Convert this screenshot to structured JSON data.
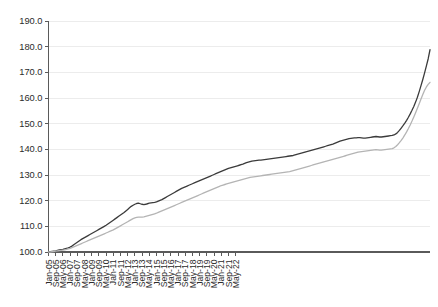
{
  "chart_data": {
    "type": "line",
    "title": "",
    "subtitle": "",
    "xlabel": "",
    "ylabel": "",
    "ylim": [
      100.0,
      190.0
    ],
    "yticks": [
      100.0,
      110.0,
      120.0,
      130.0,
      140.0,
      150.0,
      160.0,
      170.0,
      180.0,
      190.0
    ],
    "ytick_labels": [
      "100.0",
      "110.0",
      "120.0",
      "130.0",
      "140.0",
      "150.0",
      "160.0",
      "170.0",
      "180.0",
      "190.0"
    ],
    "grid": true,
    "grid_axis": "y",
    "legend": "none",
    "legend_entries": [],
    "xtick_labels": [
      "Jan-05",
      "Sep-05",
      "May-06",
      "Jan-07",
      "Sep-07",
      "May-08",
      "Jan-09",
      "Sep-09",
      "May-10",
      "Jan-11",
      "Sep-11",
      "May-12",
      "Jan-13",
      "Sep-13",
      "May-14",
      "Jan-15",
      "Sep-15",
      "May-16",
      "Jan-17",
      "Sep-17",
      "May-18",
      "Jan-19",
      "Sep-19",
      "May-20",
      "Jan-21",
      "Sep-21",
      "May-22"
    ],
    "xtick_interval_months": 4,
    "x_start": "Jan-05",
    "x_end": "Sep-22",
    "series": [
      {
        "name": "series-dark",
        "color": "#3b3b3b",
        "linewidth": 1.3,
        "x": [
          "Jan-05",
          "Feb-05",
          "Mar-05",
          "Apr-05",
          "May-05",
          "Jun-05",
          "Jul-05",
          "Aug-05",
          "Sep-05",
          "Oct-05",
          "Nov-05",
          "Dec-05",
          "Jan-06",
          "Feb-06",
          "Mar-06",
          "Apr-06",
          "May-06",
          "Jun-06",
          "Jul-06",
          "Aug-06",
          "Sep-06",
          "Oct-06",
          "Nov-06",
          "Dec-06",
          "Jan-07",
          "Feb-07",
          "Mar-07",
          "Apr-07",
          "May-07",
          "Jun-07",
          "Jul-07",
          "Aug-07",
          "Sep-07",
          "Oct-07",
          "Nov-07",
          "Dec-07",
          "Jan-08",
          "Feb-08",
          "Mar-08",
          "Apr-08",
          "May-08",
          "Jun-08",
          "Jul-08",
          "Aug-08",
          "Sep-08",
          "Oct-08",
          "Nov-08",
          "Dec-08",
          "Jan-09",
          "Feb-09",
          "Mar-09",
          "Apr-09",
          "May-09",
          "Jun-09",
          "Jul-09",
          "Aug-09",
          "Sep-09",
          "Oct-09",
          "Nov-09",
          "Dec-09",
          "Jan-10",
          "Feb-10",
          "Mar-10",
          "Apr-10",
          "May-10",
          "Jun-10",
          "Jul-10",
          "Aug-10",
          "Sep-10",
          "Oct-10",
          "Nov-10",
          "Dec-10",
          "Jan-11",
          "Feb-11",
          "Mar-11",
          "Apr-11",
          "May-11",
          "Jun-11",
          "Jul-11",
          "Aug-11",
          "Sep-11",
          "Oct-11",
          "Nov-11",
          "Dec-11",
          "Jan-12",
          "Feb-12",
          "Mar-12",
          "Apr-12",
          "May-12",
          "Jun-12",
          "Jul-12",
          "Aug-12",
          "Sep-12",
          "Oct-12",
          "Nov-12",
          "Dec-12",
          "Jan-13",
          "Feb-13",
          "Mar-13",
          "Apr-13",
          "May-13",
          "Jun-13",
          "Jul-13",
          "Aug-13",
          "Sep-13",
          "Oct-13",
          "Nov-13",
          "Dec-13",
          "Jan-14",
          "Feb-14",
          "Mar-14",
          "Apr-14",
          "May-14",
          "Jun-14",
          "Jul-14",
          "Aug-14",
          "Sep-14",
          "Oct-14",
          "Nov-14",
          "Dec-14",
          "Jan-15",
          "Feb-15",
          "Mar-15",
          "Apr-15",
          "May-15",
          "Jun-15",
          "Jul-15",
          "Aug-15",
          "Sep-15",
          "Oct-15",
          "Nov-15",
          "Dec-15",
          "Jan-16",
          "Feb-16",
          "Mar-16",
          "Apr-16",
          "May-16",
          "Jun-16",
          "Jul-16",
          "Aug-16",
          "Sep-16",
          "Oct-16",
          "Nov-16",
          "Dec-16",
          "Jan-17",
          "Feb-17",
          "Mar-17",
          "Apr-17",
          "May-17",
          "Jun-17",
          "Jul-17",
          "Aug-17",
          "Sep-17",
          "Oct-17",
          "Nov-17",
          "Dec-17",
          "Jan-18",
          "Feb-18",
          "Mar-18",
          "Apr-18",
          "May-18",
          "Jun-18",
          "Jul-18",
          "Aug-18",
          "Sep-18",
          "Oct-18",
          "Nov-18",
          "Dec-18",
          "Jan-19",
          "Feb-19",
          "Mar-19",
          "Apr-19",
          "May-19",
          "Jun-19",
          "Jul-19",
          "Aug-19",
          "Sep-19",
          "Oct-19",
          "Nov-19",
          "Dec-19",
          "Jan-20",
          "Feb-20",
          "Mar-20",
          "Apr-20",
          "May-20",
          "Jun-20",
          "Jul-20",
          "Aug-20",
          "Sep-20",
          "Oct-20",
          "Nov-20",
          "Dec-20",
          "Jan-21",
          "Feb-21",
          "Mar-21",
          "Apr-21",
          "May-21",
          "Jun-21",
          "Jul-21",
          "Aug-21",
          "Sep-21",
          "Oct-21",
          "Nov-21",
          "Dec-21",
          "Jan-22",
          "Feb-22",
          "Mar-22",
          "Apr-22",
          "May-22",
          "Jun-22",
          "Jul-22",
          "Aug-22",
          "Sep-22"
        ],
        "values": [
          100.0,
          100.1,
          100.2,
          100.3,
          100.4,
          100.6,
          100.8,
          100.9,
          101.0,
          101.2,
          101.4,
          101.6,
          101.9,
          102.3,
          102.8,
          103.3,
          103.8,
          104.3,
          104.8,
          105.2,
          105.6,
          106.0,
          106.4,
          106.8,
          107.2,
          107.6,
          108.0,
          108.4,
          108.8,
          109.2,
          109.6,
          110.0,
          110.4,
          110.9,
          111.4,
          111.9,
          112.4,
          112.9,
          113.4,
          113.9,
          114.4,
          114.9,
          115.4,
          116.0,
          116.6,
          117.2,
          117.8,
          118.2,
          118.6,
          118.9,
          119.0,
          118.8,
          118.6,
          118.5,
          118.6,
          118.8,
          119.0,
          119.1,
          119.2,
          119.3,
          119.5,
          119.8,
          120.1,
          120.4,
          120.8,
          121.2,
          121.6,
          122.0,
          122.4,
          122.8,
          123.2,
          123.6,
          124.0,
          124.4,
          124.8,
          125.1,
          125.4,
          125.7,
          126.0,
          126.3,
          126.6,
          126.9,
          127.2,
          127.5,
          127.8,
          128.1,
          128.4,
          128.7,
          129.0,
          129.3,
          129.6,
          129.9,
          130.2,
          130.5,
          130.8,
          131.1,
          131.4,
          131.7,
          132.0,
          132.3,
          132.6,
          132.8,
          133.0,
          133.2,
          133.4,
          133.6,
          133.8,
          134.0,
          134.2,
          134.5,
          134.8,
          135.0,
          135.2,
          135.4,
          135.5,
          135.6,
          135.7,
          135.8,
          135.8,
          135.9,
          136.0,
          136.1,
          136.2,
          136.3,
          136.4,
          136.5,
          136.6,
          136.7,
          136.8,
          136.9,
          137.0,
          137.1,
          137.2,
          137.3,
          137.4,
          137.5,
          137.6,
          137.8,
          138.0,
          138.2,
          138.4,
          138.6,
          138.8,
          139.0,
          139.2,
          139.4,
          139.6,
          139.8,
          140.0,
          140.2,
          140.4,
          140.6,
          140.8,
          141.0,
          141.2,
          141.4,
          141.6,
          141.8,
          142.0,
          142.3,
          142.6,
          142.9,
          143.2,
          143.4,
          143.6,
          143.8,
          144.0,
          144.2,
          144.3,
          144.4,
          144.5,
          144.5,
          144.6,
          144.6,
          144.5,
          144.4,
          144.4,
          144.5,
          144.6,
          144.7,
          144.8,
          144.9,
          145.0,
          144.9,
          144.8,
          144.8,
          144.9,
          145.0,
          145.1,
          145.2,
          145.3,
          145.4,
          145.6,
          146.0,
          146.6,
          147.4,
          148.3,
          149.2,
          150.2,
          151.3,
          152.5,
          153.8,
          155.2,
          156.7,
          158.4,
          160.3,
          162.5,
          164.8,
          167.2,
          169.8,
          172.5,
          175.3,
          178.8
        ]
      },
      {
        "name": "series-gray",
        "color": "#b4b4b4",
        "linewidth": 1.3,
        "x": [
          "Jan-05",
          "Feb-05",
          "Mar-05",
          "Apr-05",
          "May-05",
          "Jun-05",
          "Jul-05",
          "Aug-05",
          "Sep-05",
          "Oct-05",
          "Nov-05",
          "Dec-05",
          "Jan-06",
          "Feb-06",
          "Mar-06",
          "Apr-06",
          "May-06",
          "Jun-06",
          "Jul-06",
          "Aug-06",
          "Sep-06",
          "Oct-06",
          "Nov-06",
          "Dec-06",
          "Jan-07",
          "Feb-07",
          "Mar-07",
          "Apr-07",
          "May-07",
          "Jun-07",
          "Jul-07",
          "Aug-07",
          "Sep-07",
          "Oct-07",
          "Nov-07",
          "Dec-07",
          "Jan-08",
          "Feb-08",
          "Mar-08",
          "Apr-08",
          "May-08",
          "Jun-08",
          "Jul-08",
          "Aug-08",
          "Sep-08",
          "Oct-08",
          "Nov-08",
          "Dec-08",
          "Jan-09",
          "Feb-09",
          "Mar-09",
          "Apr-09",
          "May-09",
          "Jun-09",
          "Jul-09",
          "Aug-09",
          "Sep-09",
          "Oct-09",
          "Nov-09",
          "Dec-09",
          "Jan-10",
          "Feb-10",
          "Mar-10",
          "Apr-10",
          "May-10",
          "Jun-10",
          "Jul-10",
          "Aug-10",
          "Sep-10",
          "Oct-10",
          "Nov-10",
          "Dec-10",
          "Jan-11",
          "Feb-11",
          "Mar-11",
          "Apr-11",
          "May-11",
          "Jun-11",
          "Jul-11",
          "Aug-11",
          "Sep-11",
          "Oct-11",
          "Nov-11",
          "Dec-11",
          "Jan-12",
          "Feb-12",
          "Mar-12",
          "Apr-12",
          "May-12",
          "Jun-12",
          "Jul-12",
          "Aug-12",
          "Sep-12",
          "Oct-12",
          "Nov-12",
          "Dec-12",
          "Jan-13",
          "Feb-13",
          "Mar-13",
          "Apr-13",
          "May-13",
          "Jun-13",
          "Jul-13",
          "Aug-13",
          "Sep-13",
          "Oct-13",
          "Nov-13",
          "Dec-13",
          "Jan-14",
          "Feb-14",
          "Mar-14",
          "Apr-14",
          "May-14",
          "Jun-14",
          "Jul-14",
          "Aug-14",
          "Sep-14",
          "Oct-14",
          "Nov-14",
          "Dec-14",
          "Jan-15",
          "Feb-15",
          "Mar-15",
          "Apr-15",
          "May-15",
          "Jun-15",
          "Jul-15",
          "Aug-15",
          "Sep-15",
          "Oct-15",
          "Nov-15",
          "Dec-15",
          "Jan-16",
          "Feb-16",
          "Mar-16",
          "Apr-16",
          "May-16",
          "Jun-16",
          "Jul-16",
          "Aug-16",
          "Sep-16",
          "Oct-16",
          "Nov-16",
          "Dec-16",
          "Jan-17",
          "Feb-17",
          "Mar-17",
          "Apr-17",
          "May-17",
          "Jun-17",
          "Jul-17",
          "Aug-17",
          "Sep-17",
          "Oct-17",
          "Nov-17",
          "Dec-17",
          "Jan-18",
          "Feb-18",
          "Mar-18",
          "Apr-18",
          "May-18",
          "Jun-18",
          "Jul-18",
          "Aug-18",
          "Sep-18",
          "Oct-18",
          "Nov-18",
          "Dec-18",
          "Jan-19",
          "Feb-19",
          "Mar-19",
          "Apr-19",
          "May-19",
          "Jun-19",
          "Jul-19",
          "Aug-19",
          "Sep-19",
          "Oct-19",
          "Nov-19",
          "Dec-19",
          "Jan-20",
          "Feb-20",
          "Mar-20",
          "Apr-20",
          "May-20",
          "Jun-20",
          "Jul-20",
          "Aug-20",
          "Sep-20",
          "Oct-20",
          "Nov-20",
          "Dec-20",
          "Jan-21",
          "Feb-21",
          "Mar-21",
          "Apr-21",
          "May-21",
          "Jun-21",
          "Jul-21",
          "Aug-21",
          "Sep-21",
          "Oct-21",
          "Nov-21",
          "Dec-21",
          "Jan-22",
          "Feb-22",
          "Mar-22",
          "Apr-22",
          "May-22",
          "Jun-22",
          "Jul-22",
          "Aug-22",
          "Sep-22"
        ],
        "values": [
          100.0,
          100.0,
          100.1,
          100.2,
          100.3,
          100.4,
          100.5,
          100.6,
          100.7,
          100.8,
          101.0,
          101.2,
          101.4,
          101.7,
          102.0,
          102.3,
          102.6,
          102.9,
          103.2,
          103.5,
          103.8,
          104.1,
          104.4,
          104.7,
          105.0,
          105.3,
          105.6,
          105.9,
          106.2,
          106.5,
          106.8,
          107.1,
          107.4,
          107.7,
          108.0,
          108.3,
          108.6,
          109.0,
          109.4,
          109.8,
          110.2,
          110.6,
          111.0,
          111.4,
          111.8,
          112.2,
          112.6,
          113.0,
          113.3,
          113.5,
          113.6,
          113.6,
          113.6,
          113.7,
          113.9,
          114.1,
          114.3,
          114.5,
          114.7,
          114.9,
          115.1,
          115.4,
          115.7,
          116.0,
          116.3,
          116.6,
          116.9,
          117.2,
          117.5,
          117.8,
          118.1,
          118.4,
          118.7,
          119.0,
          119.3,
          119.6,
          119.9,
          120.2,
          120.5,
          120.8,
          121.1,
          121.4,
          121.7,
          122.0,
          122.3,
          122.6,
          122.9,
          123.2,
          123.5,
          123.8,
          124.1,
          124.4,
          124.7,
          125.0,
          125.3,
          125.6,
          125.9,
          126.1,
          126.3,
          126.5,
          126.7,
          126.9,
          127.1,
          127.3,
          127.5,
          127.7,
          127.9,
          128.1,
          128.3,
          128.5,
          128.7,
          128.9,
          129.1,
          129.2,
          129.3,
          129.4,
          129.5,
          129.6,
          129.7,
          129.8,
          129.9,
          130.0,
          130.1,
          130.2,
          130.3,
          130.4,
          130.5,
          130.6,
          130.7,
          130.8,
          130.9,
          131.0,
          131.1,
          131.2,
          131.3,
          131.5,
          131.7,
          131.9,
          132.1,
          132.3,
          132.5,
          132.7,
          132.9,
          133.1,
          133.3,
          133.5,
          133.7,
          133.9,
          134.1,
          134.3,
          134.5,
          134.7,
          134.9,
          135.1,
          135.3,
          135.5,
          135.7,
          135.9,
          136.1,
          136.3,
          136.5,
          136.7,
          136.9,
          137.1,
          137.3,
          137.5,
          137.7,
          137.9,
          138.1,
          138.3,
          138.5,
          138.7,
          138.9,
          139.0,
          139.1,
          139.2,
          139.3,
          139.4,
          139.5,
          139.6,
          139.7,
          139.8,
          139.9,
          139.8,
          139.7,
          139.7,
          139.8,
          139.9,
          140.0,
          140.1,
          140.2,
          140.3,
          140.6,
          141.1,
          141.8,
          142.6,
          143.5,
          144.5,
          145.6,
          146.8,
          148.1,
          149.5,
          151.0,
          152.6,
          154.3,
          156.0,
          157.8,
          159.6,
          161.4,
          163.0,
          164.3,
          165.3,
          166.1
        ]
      }
    ]
  }
}
